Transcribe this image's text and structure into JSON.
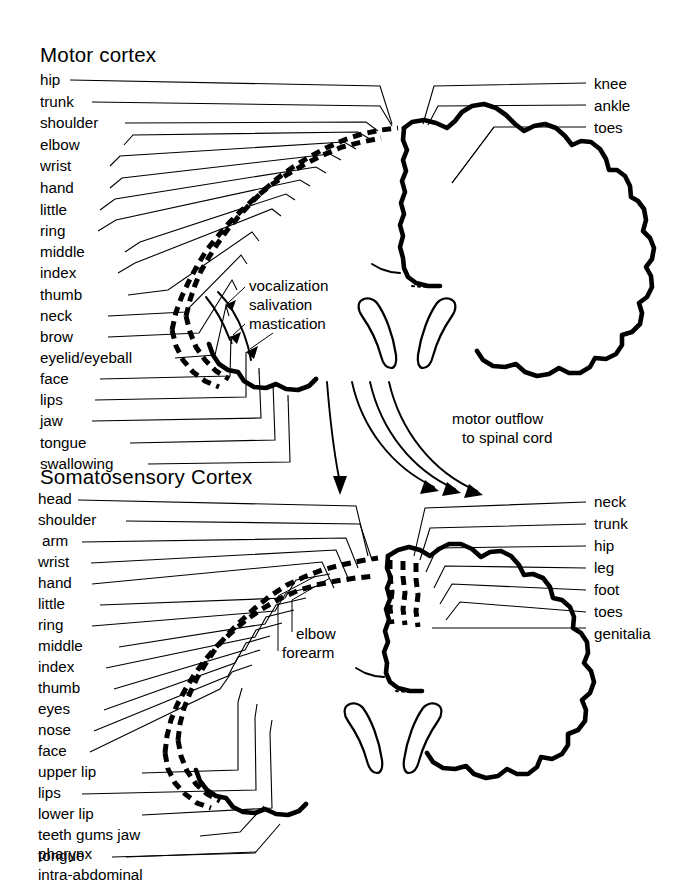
{
  "figure": {
    "background_color": "#ffffff",
    "ink_color": "#000000"
  },
  "motor": {
    "section_title": "Motor cortex",
    "left_labels": [
      "hip",
      "trunk",
      "shoulder",
      "elbow",
      "wrist",
      "hand",
      "little",
      "ring",
      "middle",
      "index",
      "thumb",
      "neck",
      "brow",
      "eyelid/eyeball",
      "face",
      "lips",
      "jaw",
      "tongue",
      "swallowing"
    ],
    "right_labels": [
      "knee",
      "ankle",
      "toes"
    ],
    "inner_labels": [
      "vocalization",
      "salivation",
      "mastication"
    ],
    "outflow_caption_line1": "motor outflow",
    "outflow_caption_line2": "to spinal cord"
  },
  "somatosensory": {
    "section_title": "Somatosensory Cortex",
    "left_labels": [
      "head",
      "shoulder",
      "arm",
      "wrist",
      "hand",
      "little",
      "ring",
      "middle",
      "index",
      "thumb",
      "eyes",
      "nose",
      "face",
      "upper lip",
      "lips",
      "lower lip",
      "teeth gums jaw",
      "tongue",
      "pharynx",
      "intra-abdominal"
    ],
    "right_labels": [
      "neck",
      "trunk",
      "hip",
      "leg",
      "foot",
      "toes",
      "genitalia"
    ],
    "inner_labels": [
      "elbow",
      "forearm"
    ]
  }
}
